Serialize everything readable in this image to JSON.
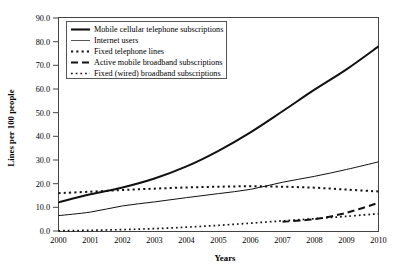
{
  "chart_data": {
    "type": "line",
    "title": "",
    "xlabel": "Years",
    "ylabel": "Lines per 100 people",
    "x": [
      2000,
      2001,
      2002,
      2003,
      2004,
      2005,
      2006,
      2007,
      2008,
      2009,
      2010
    ],
    "categories": [
      "2000",
      "2001",
      "2002",
      "2003",
      "2004",
      "2005",
      "2006",
      "2007",
      "2008",
      "2009",
      "2010"
    ],
    "xlim": [
      2000,
      2010
    ],
    "ylim": [
      0.0,
      90.0
    ],
    "yticks": [
      0.0,
      10.0,
      20.0,
      30.0,
      40.0,
      50.0,
      60.0,
      70.0,
      80.0,
      90.0
    ],
    "ytick_labels": [
      "0.0",
      "10.0",
      "20.0",
      "30.0",
      "40.0",
      "50.0",
      "60.0",
      "70.0",
      "80.0",
      "90.0"
    ],
    "grid": false,
    "legend_position": "top-left",
    "series": [
      {
        "name": "Mobile cellular telephone subscriptions",
        "style": "solid-thick",
        "color": "#111111",
        "values": [
          12.1,
          15.5,
          18.4,
          22.2,
          27.3,
          33.9,
          41.7,
          50.6,
          59.7,
          68.3,
          78.0
        ]
      },
      {
        "name": "Internet users",
        "style": "solid-thin",
        "color": "#555555",
        "values": [
          6.5,
          8.0,
          10.6,
          12.3,
          14.1,
          15.8,
          17.6,
          20.6,
          23.1,
          26.0,
          29.2
        ]
      },
      {
        "name": "Fixed telephone lines",
        "style": "dotted-square",
        "color": "#111111",
        "values": [
          16.0,
          16.6,
          17.3,
          17.9,
          18.4,
          18.7,
          18.9,
          18.7,
          18.3,
          17.5,
          16.7
        ]
      },
      {
        "name": "Active mobile broadband subscriptions",
        "style": "dashed-long",
        "color": "#111111",
        "values": [
          null,
          null,
          null,
          null,
          null,
          null,
          null,
          3.9,
          5.0,
          7.7,
          11.9
        ]
      },
      {
        "name": "Fixed (wired) broadband subscriptions",
        "style": "dotted-fine",
        "color": "#111111",
        "values": [
          0.1,
          0.3,
          0.6,
          1.0,
          1.6,
          2.4,
          3.3,
          4.3,
          5.2,
          6.2,
          7.3
        ]
      }
    ]
  },
  "legend": {
    "items": [
      {
        "label": "Mobile cellular telephone subscriptions",
        "swatch": "solid-thick-swatch"
      },
      {
        "label": "Internet users",
        "swatch": "solid-thin-swatch"
      },
      {
        "label": "Fixed telephone lines",
        "swatch": "dotted-square-swatch"
      },
      {
        "label": "Active mobile broadband subscriptions",
        "swatch": "dashed-long-swatch"
      },
      {
        "label": "Fixed (wired) broadband subscriptions",
        "swatch": "dotted-fine-swatch"
      }
    ]
  },
  "axes": {
    "y_title": "Lines per 100 people",
    "x_title": "Years",
    "y_labels": [
      "90.0",
      "80.0",
      "70.0",
      "60.0",
      "50.0",
      "40.0",
      "30.0",
      "20.0",
      "10.0",
      "0.0"
    ],
    "x_labels": [
      "2000",
      "2001",
      "2002",
      "2003",
      "2004",
      "2005",
      "2006",
      "2007",
      "2008",
      "2009",
      "2010"
    ]
  }
}
